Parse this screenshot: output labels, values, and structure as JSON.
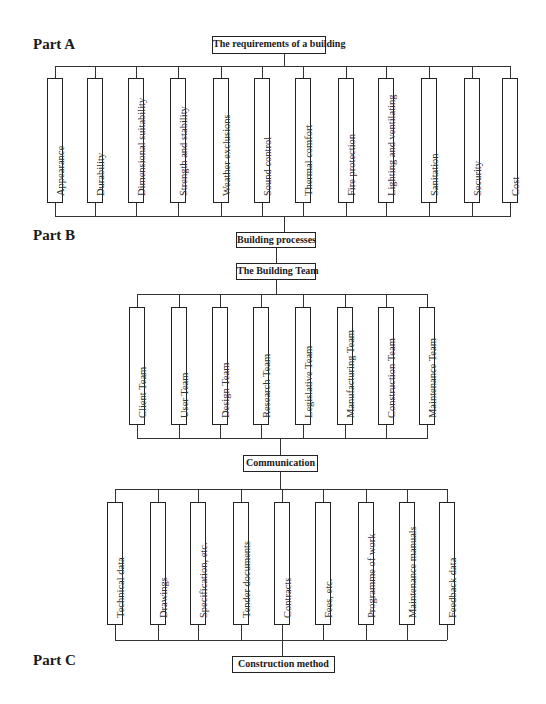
{
  "parts": {
    "a": {
      "label": "Part A"
    },
    "b": {
      "label": "Part B"
    },
    "c": {
      "label": "Part C"
    }
  },
  "nodes": {
    "requirements": "The requirements of a building",
    "building_processes": "Building processes",
    "building_team": "The Building Team",
    "communication": "Communication",
    "construction_method": "Construction method"
  },
  "requirements": [
    "Appearance",
    "Durability",
    "Dimensional  suitability",
    "Strength and stability",
    "Weather exclusions",
    "Sound control",
    "Thermal comfort",
    "Fire protection",
    "Lighting and ventilating",
    "Sanitation",
    "Security",
    "Cost"
  ],
  "teams": [
    "Client Team",
    "User Team",
    "Design Team",
    "Research Team",
    "Legislative Team",
    "Manufacturing Team",
    "Construction Team",
    "Maintenance Team"
  ],
  "communications": [
    "Technical data",
    "Drawings",
    "Specification, etc.",
    "Tender documents",
    "Contracts",
    "Fees, etc.",
    "Programme of work",
    "Maintenance manuals",
    "Feedback data"
  ]
}
